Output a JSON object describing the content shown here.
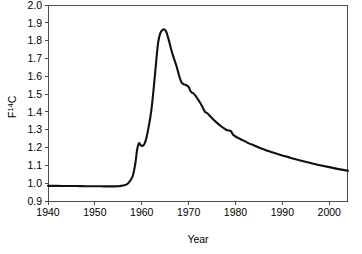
{
  "figure": {
    "background_color": "#ffffff",
    "line_color": "#111111",
    "axis_color": "#4d4d4d",
    "caption_fragment": ""
  },
  "chart_data": {
    "type": "line",
    "title": "",
    "xlabel": "Year",
    "ylabel": "F14C",
    "ylabel_base": "F",
    "ylabel_superscript": "14",
    "ylabel_suffix": "C",
    "xlim": [
      1940,
      2004
    ],
    "ylim": [
      0.9,
      2.0
    ],
    "grid": false,
    "legend": false,
    "xticks": [
      1940,
      1950,
      1960,
      1970,
      1980,
      1990,
      2000
    ],
    "xtick_labels": [
      "1940",
      "1950",
      "1960",
      "1970",
      "1980",
      "1990",
      "2000"
    ],
    "yticks": [
      0.9,
      1.0,
      1.1,
      1.2,
      1.3,
      1.4,
      1.5,
      1.6,
      1.7,
      1.8,
      1.9,
      2.0
    ],
    "ytick_labels": [
      "0.9",
      "1.0",
      "1.1",
      "1.2",
      "1.3",
      "1.4",
      "1.5",
      "1.6",
      "1.7",
      "1.8",
      "1.9",
      "2.0"
    ],
    "series": [
      {
        "name": "Atmospheric F14C (bomb pulse)",
        "x": [
          1940,
          1942,
          1944,
          1946,
          1948,
          1950,
          1952,
          1953,
          1954,
          1955,
          1956,
          1957,
          1958,
          1958.6,
          1959,
          1959.4,
          1959.8,
          1960.2,
          1960.6,
          1961,
          1961.5,
          1962,
          1962.5,
          1963,
          1963.5,
          1964,
          1964.5,
          1965,
          1965.3,
          1965.8,
          1966.5,
          1967,
          1967.5,
          1968,
          1968.5,
          1969,
          1969.5,
          1970,
          1970.5,
          1971,
          1971.5,
          1972,
          1972.5,
          1973,
          1973.5,
          1974,
          1975,
          1976,
          1977,
          1978,
          1978.5,
          1979,
          1979.5,
          1980,
          1980.5,
          1981,
          1982,
          1983,
          1984,
          1985,
          1986,
          1987,
          1988,
          1990,
          1992,
          1994,
          1996,
          1998,
          2000,
          2002,
          2004
        ],
        "y": [
          0.985,
          0.985,
          0.984,
          0.984,
          0.983,
          0.983,
          0.982,
          0.982,
          0.982,
          0.983,
          0.987,
          0.997,
          1.035,
          1.105,
          1.185,
          1.225,
          1.212,
          1.21,
          1.222,
          1.255,
          1.32,
          1.4,
          1.52,
          1.66,
          1.79,
          1.845,
          1.862,
          1.86,
          1.845,
          1.8,
          1.73,
          1.69,
          1.65,
          1.6,
          1.565,
          1.555,
          1.55,
          1.54,
          1.512,
          1.505,
          1.49,
          1.47,
          1.45,
          1.425,
          1.4,
          1.392,
          1.365,
          1.34,
          1.318,
          1.3,
          1.296,
          1.292,
          1.272,
          1.262,
          1.255,
          1.248,
          1.235,
          1.222,
          1.212,
          1.2,
          1.19,
          1.18,
          1.172,
          1.156,
          1.14,
          1.126,
          1.113,
          1.101,
          1.09,
          1.079,
          1.07
        ],
        "color": "#111111",
        "linewidth": 2.1
      }
    ],
    "annotations": {
      "baseline_value": 0.985,
      "baseline_period": "1940-1955",
      "peak_value": 1.862,
      "peak_year": 1964.5,
      "pre_peak_bump_value": 1.225,
      "pre_peak_bump_year": 1959.4,
      "end_value": 1.07,
      "end_year": 2004
    }
  },
  "axes_geometry": {
    "plot_left": 48,
    "plot_right": 348,
    "plot_top": 5,
    "plot_bottom": 201
  }
}
